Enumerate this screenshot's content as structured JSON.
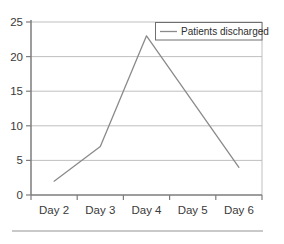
{
  "chart_data": {
    "type": "line",
    "title": "",
    "xlabel": "",
    "ylabel": "",
    "categories": [
      "Day 2",
      "Day 3",
      "Day 4",
      "Day 5",
      "Day 6"
    ],
    "series": [
      {
        "name": "Patients discharged",
        "values": [
          2,
          7,
          23,
          13.5,
          4
        ],
        "color": "#8a8a8a"
      }
    ],
    "ylim": [
      0,
      25
    ],
    "yticks": [
      0,
      5,
      10,
      15,
      20,
      25
    ],
    "ytick_labels": [
      "0",
      "5",
      "10",
      "15",
      "20",
      "25"
    ],
    "grid": true,
    "grid_axis": "y",
    "legend": {
      "visible": true,
      "position": "top-right",
      "entries": [
        {
          "label": "Patients discharged",
          "color": "#8a8a8a"
        }
      ]
    },
    "colors": {
      "axis": "#7d7d7d",
      "grid": "#b8b8b8",
      "line": "#8a8a8a",
      "text": "#3a3a3a",
      "legend_border": "#6f6f6f",
      "footer_rule": "#c9c9c9",
      "background": "#ffffff"
    }
  },
  "footer": {
    "rule_visible": true
  }
}
